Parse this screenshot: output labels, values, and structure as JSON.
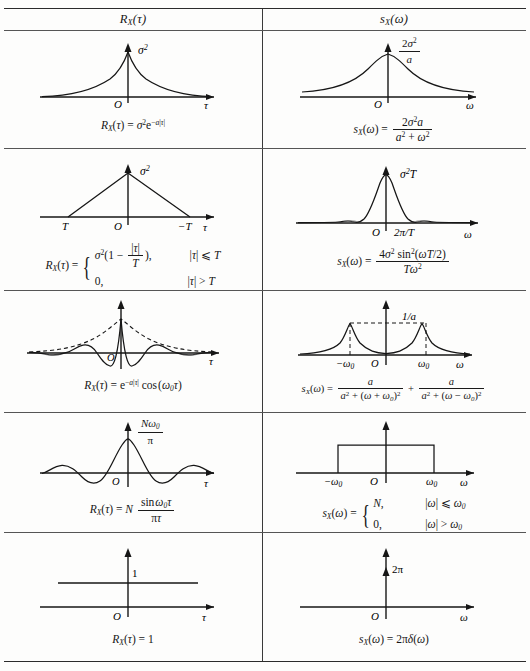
{
  "table": {
    "headers": {
      "left": "R_X(τ)",
      "right": "s_X(ω)"
    },
    "rows": [
      {
        "id": "exponential",
        "left": {
          "plot_name": "two-sided-exponential-plot",
          "y_label": "σ²",
          "x_label": "τ",
          "origin_label": "O",
          "formula_parts": {
            "lhs": "R_X(τ) =",
            "rhs": "σ²e^{-a|τ|}"
          }
        },
        "right": {
          "plot_name": "lorentzian-plot",
          "y_label_num": "2σ²",
          "y_label_den": "a",
          "x_label": "ω",
          "origin_label": "O",
          "formula_parts": {
            "lhs": "s_X(ω) =",
            "num": "2σ²a",
            "den": "a² + ω²"
          }
        }
      },
      {
        "id": "triangular",
        "left": {
          "plot_name": "triangular-plot",
          "y_label": "σ²",
          "x_label": "τ",
          "origin_label": "O",
          "tick_left": "T",
          "tick_right": "−T",
          "formula_parts": {
            "lhs": "R_X(τ) =",
            "case1_value": "σ²(1 − |τ|/T),",
            "case1_cond": "|τ| ⩽ T",
            "case2_value": "0,",
            "case2_cond": "|τ| > T"
          }
        },
        "right": {
          "plot_name": "sinc-squared-plot",
          "y_label": "σ²T",
          "x_label": "ω",
          "origin_label": "O",
          "tick_label": "2π/T",
          "formula_parts": {
            "lhs": "s_X(ω) =",
            "num": "4σ² sin²(ωT/2)",
            "den": "Tω²"
          }
        }
      },
      {
        "id": "damped-cosine",
        "left": {
          "plot_name": "damped-cosine-plot",
          "x_label": "τ",
          "origin_label": "O",
          "formula_parts": {
            "lhs": "R_X(τ) =",
            "rhs": "e^{-a|τ|} cos(ω₀τ)"
          }
        },
        "right": {
          "plot_name": "double-lorentzian-plot",
          "y_label": "1/a",
          "x_label": "ω",
          "origin_label": "O",
          "tick_left": "−ω₀",
          "tick_right": "ω₀",
          "formula_parts": {
            "lhs": "s_X(ω) =",
            "num1": "a",
            "den1": "a² + (ω + ω₀)²",
            "plus": "+",
            "num2": "a",
            "den2": "a² + (ω − ω₀)²"
          }
        }
      },
      {
        "id": "sinc",
        "left": {
          "plot_name": "sinc-plot",
          "y_label_num": "Nω₀",
          "y_label_den": "π",
          "x_label": "τ",
          "origin_label": "O",
          "formula_parts": {
            "lhs": "R_X(τ) = N",
            "num": "sin ω₀τ",
            "den": "πτ"
          }
        },
        "right": {
          "plot_name": "rectangular-bandpass-plot",
          "x_label": "ω",
          "origin_label": "O",
          "tick_left": "−ω₀",
          "tick_right": "ω₀",
          "formula_parts": {
            "lhs": "s_X(ω) =",
            "case1_value": "N,",
            "case1_cond": "|ω| ⩽ ω₀",
            "case2_value": "0,",
            "case2_cond": "|ω| > ω₀"
          }
        }
      },
      {
        "id": "constant",
        "left": {
          "plot_name": "constant-one-plot",
          "y_label": "1",
          "x_label": "τ",
          "origin_label": "O",
          "formula_parts": {
            "lhs": "R_X(τ) =",
            "rhs": "1"
          }
        },
        "right": {
          "plot_name": "delta-impulse-plot",
          "y_label": "2π",
          "x_label": "ω",
          "origin_label": "O",
          "formula_parts": {
            "lhs": "s_X(ω) =",
            "rhs": "2πδ(ω)"
          }
        }
      }
    ]
  },
  "colors": {
    "ink": "#161616",
    "rule": "#3a3a3a",
    "paper": "#fdfdfc"
  }
}
